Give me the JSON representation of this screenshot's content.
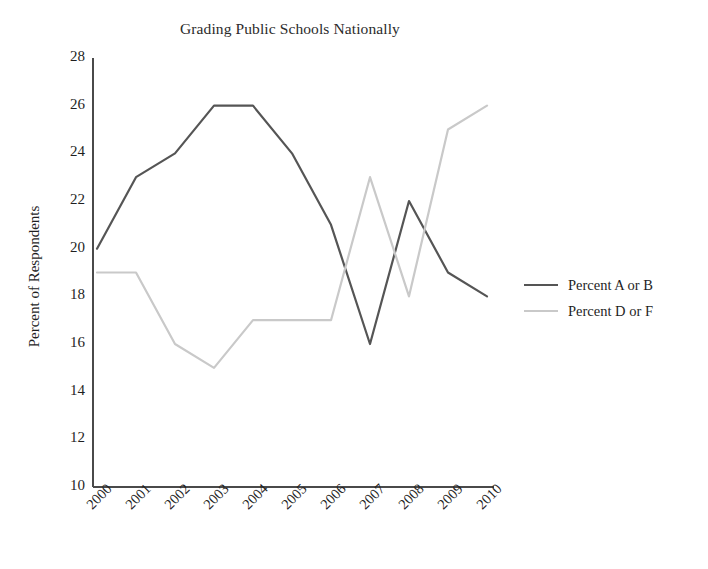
{
  "chart_data": {
    "type": "line",
    "title": "Grading Public Schools Nationally",
    "xlabel": "",
    "ylabel": "Percent of Respondents",
    "categories": [
      "2000",
      "2001",
      "2002",
      "2003",
      "2004",
      "2005",
      "2006",
      "2007",
      "2008",
      "2009",
      "2010"
    ],
    "x": [
      2000,
      2001,
      2002,
      2003,
      2004,
      2005,
      2006,
      2007,
      2008,
      2009,
      2010
    ],
    "series": [
      {
        "name": "Percent  A or B",
        "color": "#555555",
        "values": [
          20,
          23,
          24,
          26,
          26,
          24,
          21,
          16,
          22,
          19,
          18
        ]
      },
      {
        "name": "Percent  D or F",
        "color": "#c9c9c9",
        "values": [
          19,
          19,
          16,
          15,
          17,
          17,
          17,
          23,
          18,
          25,
          26
        ]
      }
    ],
    "ylim": [
      10,
      28
    ],
    "yticks": [
      28,
      26,
      24,
      22,
      20,
      18,
      16,
      14,
      12,
      10
    ],
    "grid": false,
    "legend_position": "right"
  },
  "legend": {
    "entries": [
      {
        "label": "Percent  A or B",
        "color": "#555555"
      },
      {
        "label": "Percent  D or F",
        "color": "#c9c9c9"
      }
    ]
  }
}
